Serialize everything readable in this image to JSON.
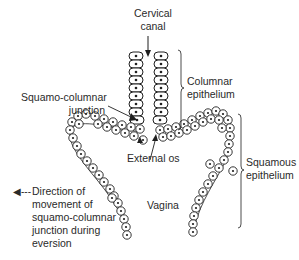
{
  "figure": {
    "type": "anatomical-diagram"
  },
  "labels": {
    "cervical_canal": [
      "Cervical",
      "canal"
    ],
    "columnar_epithelium": [
      "Columnar",
      "epithelium"
    ],
    "squamo_columnar_junction": [
      "Squamo-columnar",
      "junction"
    ],
    "external_os": "External os",
    "squamous_epithelium": [
      "Squamous",
      "epithelium"
    ],
    "vagina": "Vagina",
    "legend": {
      "arrow_symbol": "◀---",
      "lines": [
        "Direction of",
        "movement of",
        "squamo-columnar",
        "junction during",
        "eversion"
      ]
    }
  },
  "colors": {
    "stroke": "#1f1f1f",
    "text": "#2a2a2a",
    "background": "#ffffff"
  }
}
